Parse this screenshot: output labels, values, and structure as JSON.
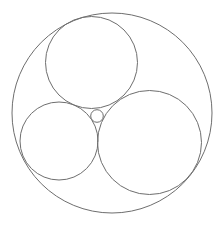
{
  "diagram": {
    "type": "apollonian-circles",
    "width": 219,
    "height": 225,
    "background": "#ffffff",
    "stroke": "#6e6e6e",
    "stroke_width": 1,
    "circles": [
      {
        "name": "outer-circle",
        "cx": 112,
        "cy": 113,
        "r": 100
      },
      {
        "name": "top-circle",
        "cx": 91.5,
        "cy": 62.5,
        "r": 46
      },
      {
        "name": "left-circle",
        "cx": 59,
        "cy": 141,
        "r": 39
      },
      {
        "name": "right-circle",
        "cx": 149.5,
        "cy": 142.5,
        "r": 52
      },
      {
        "name": "inner-small-circle",
        "cx": 97,
        "cy": 116,
        "r": 6.3
      }
    ]
  }
}
